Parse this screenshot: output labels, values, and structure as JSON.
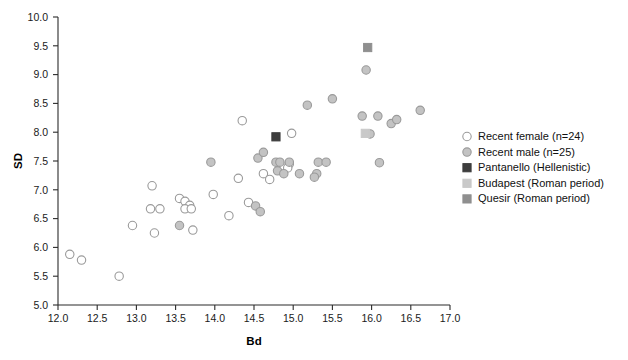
{
  "chart_data": {
    "type": "scatter",
    "title": "",
    "xlabel": "Bd",
    "ylabel": "SD",
    "xlim": [
      12.0,
      17.0
    ],
    "ylim": [
      5.0,
      10.0
    ],
    "xticks": [
      "12.0",
      "12.5",
      "13.0",
      "13.5",
      "14.0",
      "14.5",
      "15.0",
      "15.5",
      "16.0",
      "16.5",
      "17.0"
    ],
    "yticks": [
      "5.0",
      "5.5",
      "6.0",
      "6.5",
      "7.0",
      "7.5",
      "8.0",
      "8.5",
      "9.0",
      "9.5",
      "10.0"
    ],
    "grid": false,
    "legend_position": "right",
    "series": [
      {
        "name": "Recent female (n=24)",
        "marker": "open-circle",
        "color": "#ffffff",
        "edge_color": "#9a9a9a",
        "points": [
          [
            12.15,
            5.88
          ],
          [
            12.3,
            5.78
          ],
          [
            12.78,
            5.5
          ],
          [
            12.95,
            6.38
          ],
          [
            13.2,
            7.07
          ],
          [
            13.18,
            6.67
          ],
          [
            13.3,
            6.67
          ],
          [
            13.23,
            6.25
          ],
          [
            13.55,
            6.85
          ],
          [
            13.62,
            6.8
          ],
          [
            13.68,
            6.73
          ],
          [
            13.62,
            6.67
          ],
          [
            13.7,
            6.67
          ],
          [
            13.72,
            6.3
          ],
          [
            13.98,
            6.92
          ],
          [
            14.18,
            6.55
          ],
          [
            14.3,
            7.2
          ],
          [
            14.35,
            8.2
          ],
          [
            14.43,
            6.78
          ],
          [
            14.62,
            7.28
          ],
          [
            14.7,
            7.18
          ],
          [
            14.98,
            7.98
          ],
          [
            14.95,
            7.45
          ],
          [
            14.93,
            7.38
          ]
        ]
      },
      {
        "name": "Recent male (n=25)",
        "marker": "filled-circle",
        "color": "#c3c3c3",
        "edge_color": "#9a9a9a",
        "points": [
          [
            13.55,
            6.38
          ],
          [
            13.95,
            7.48
          ],
          [
            14.52,
            6.72
          ],
          [
            14.58,
            6.62
          ],
          [
            14.55,
            7.55
          ],
          [
            14.62,
            7.65
          ],
          [
            14.78,
            7.48
          ],
          [
            14.8,
            7.33
          ],
          [
            14.83,
            7.48
          ],
          [
            14.88,
            7.28
          ],
          [
            14.95,
            7.48
          ],
          [
            15.08,
            7.28
          ],
          [
            15.3,
            7.28
          ],
          [
            15.27,
            7.22
          ],
          [
            15.32,
            7.48
          ],
          [
            15.18,
            8.47
          ],
          [
            15.42,
            7.48
          ],
          [
            15.5,
            8.58
          ],
          [
            15.93,
            9.08
          ],
          [
            15.88,
            8.28
          ],
          [
            16.1,
            7.47
          ],
          [
            16.08,
            8.28
          ],
          [
            16.25,
            8.15
          ],
          [
            16.32,
            8.22
          ],
          [
            16.62,
            8.38
          ],
          [
            15.98,
            7.97
          ]
        ]
      },
      {
        "name": "Pantanello (Hellenistic)",
        "marker": "filled-square",
        "color": "#3d3d3d",
        "edge_color": "#3d3d3d",
        "points": [
          [
            14.78,
            7.92
          ]
        ]
      },
      {
        "name": "Budapest (Roman period)",
        "marker": "filled-square",
        "color": "#c9c9c9",
        "edge_color": "#c9c9c9",
        "points": [
          [
            15.92,
            7.98
          ]
        ]
      },
      {
        "name": "Quesir (Roman period)",
        "marker": "filled-square",
        "color": "#8f8f8f",
        "edge_color": "#8f8f8f",
        "points": [
          [
            15.95,
            9.47
          ]
        ]
      }
    ]
  },
  "legend": {
    "items": [
      {
        "label": "Recent female (n=24)",
        "marker": "open-circle",
        "color": "#ffffff",
        "edge": "#9a9a9a"
      },
      {
        "label": "Recent male (n=25)",
        "marker": "filled-circle",
        "color": "#c3c3c3",
        "edge": "#9a9a9a"
      },
      {
        "label": "Pantanello (Hellenistic)",
        "marker": "filled-square",
        "color": "#3d3d3d",
        "edge": "#3d3d3d"
      },
      {
        "label": "Budapest (Roman period)",
        "marker": "filled-square",
        "color": "#c9c9c9",
        "edge": "#c9c9c9"
      },
      {
        "label": "Quesir (Roman period)",
        "marker": "filled-square",
        "color": "#8f8f8f",
        "edge": "#8f8f8f"
      }
    ]
  }
}
